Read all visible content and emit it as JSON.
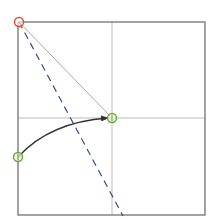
{
  "diagram": {
    "frame": {
      "x": 18,
      "y": 22,
      "width": 187,
      "height": 193,
      "stroke": "#666666"
    },
    "gridlines": {
      "vertical_x": 112,
      "horizontal_y": 118,
      "stroke": "#bbbbbb"
    },
    "points": [
      {
        "id": "origin",
        "x": 19,
        "y": 22,
        "color": "#e05030",
        "shape": "circle"
      },
      {
        "id": "target",
        "x": 112,
        "y": 118,
        "color": "#6aaa3a",
        "shape": "circle-with-tick"
      },
      {
        "id": "start",
        "x": 18,
        "y": 157,
        "color": "#6aaa3a",
        "shape": "circle-with-tick"
      }
    ],
    "connectors": {
      "solid_line": {
        "from": "origin",
        "to": "target",
        "stroke": "#aaaaaa"
      },
      "dashed_line": {
        "x1": 19,
        "y1": 22,
        "x2": 123,
        "y2": 216,
        "stroke": "#3a4a8a"
      },
      "curved_arrow": {
        "from": "start",
        "to": "target",
        "stroke": "#333333"
      }
    }
  }
}
